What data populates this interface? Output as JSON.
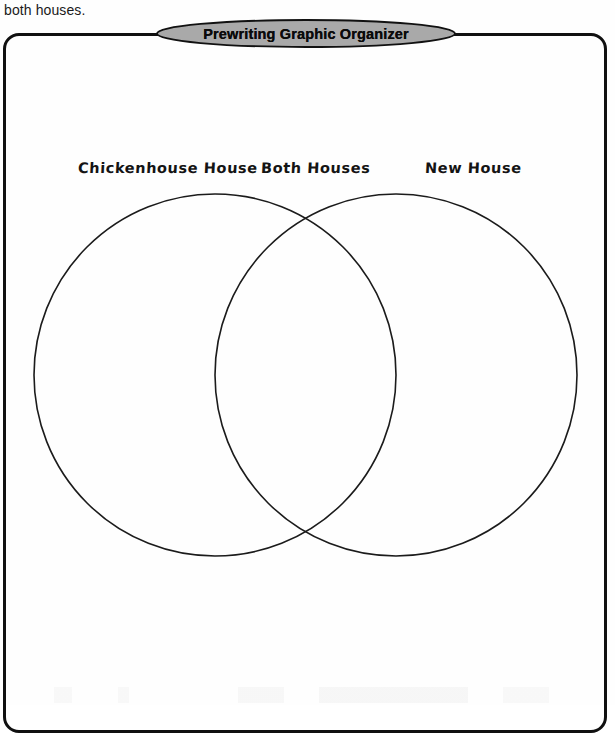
{
  "document": {
    "type": "worksheet",
    "top_text_fragment": "both houses."
  },
  "banner": {
    "title": "Prewriting Graphic Organizer",
    "shape": "ellipse",
    "fill_color": "#a9a9a9",
    "stroke_color": "#111111"
  },
  "frame": {
    "shape": "rounded-rectangle",
    "stroke_color": "#101010"
  },
  "venn": {
    "type": "two-circle-venn",
    "stroke_color": "#1b1b1b",
    "labels": {
      "left": "Chickenhouse House",
      "middle": "Both Houses",
      "right": "New House"
    },
    "circles": [
      {
        "name": "left-circle",
        "cx": 215,
        "cy": 375,
        "r": 181,
        "label": "Chickenhouse House"
      },
      {
        "name": "right-circle",
        "cx": 396,
        "cy": 375,
        "r": 181,
        "label": "New House"
      }
    ],
    "contents": {
      "left_only": [],
      "intersection": [],
      "right_only": []
    }
  }
}
